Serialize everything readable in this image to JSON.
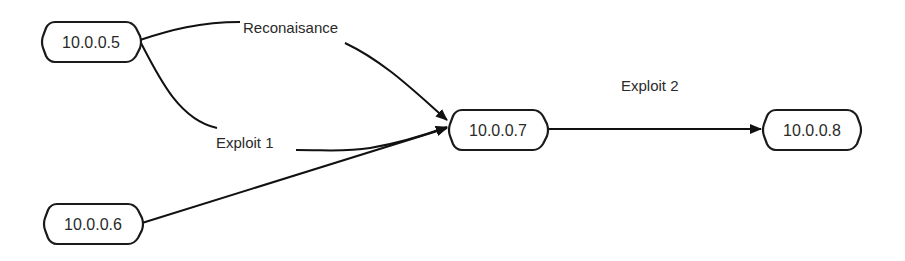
{
  "diagram": {
    "type": "attack-graph",
    "nodes": [
      {
        "id": "n5",
        "label": "10.0.0.5"
      },
      {
        "id": "n6",
        "label": "10.0.0.6"
      },
      {
        "id": "n7",
        "label": "10.0.0.7"
      },
      {
        "id": "n8",
        "label": "10.0.0.8"
      }
    ],
    "edges": [
      {
        "from": "n5",
        "to": "n7",
        "label": "Reconaisance"
      },
      {
        "from": "n5",
        "to": "n7",
        "label": "Exploit 1"
      },
      {
        "from": "n6",
        "to": "n7",
        "label": ""
      },
      {
        "from": "n7",
        "to": "n8",
        "label": "Exploit 2"
      }
    ]
  },
  "colors": {
    "stroke": "#111111",
    "text": "#2a2a2a",
    "background": "#ffffff"
  }
}
